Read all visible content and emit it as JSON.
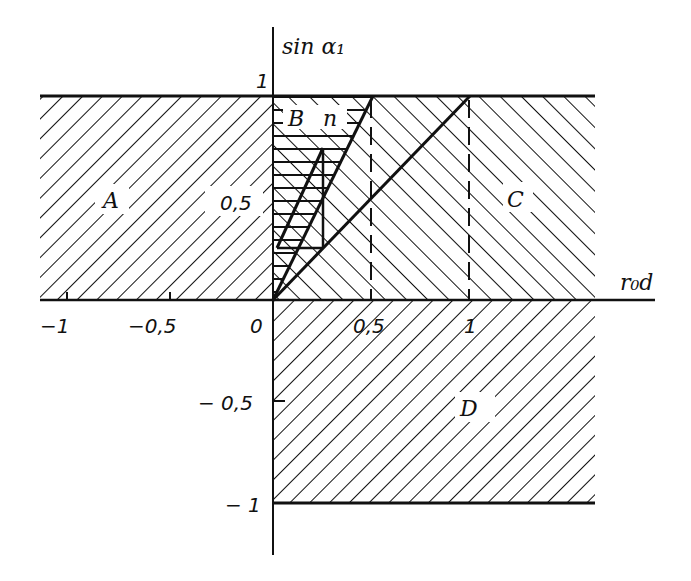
{
  "diagram": {
    "y_axis_label": "sin α₁",
    "x_axis_label": "r₀d",
    "region_labels": {
      "A": "A",
      "B": "B",
      "n": "n",
      "C": "C",
      "D": "D"
    },
    "x_ticks": [
      {
        "label": "−1",
        "value": -1
      },
      {
        "label": "−0,5",
        "value": -0.5
      },
      {
        "label": "0",
        "value": 0
      },
      {
        "label": "0,5",
        "value": 0.5
      },
      {
        "label": "1",
        "value": 1
      }
    ],
    "y_ticks": [
      {
        "label": "1",
        "value": 1
      },
      {
        "label": "0,5",
        "value": 0.5
      },
      {
        "label": "− 0,5",
        "value": -0.5
      },
      {
        "label": "− 1",
        "value": -1
      }
    ],
    "lines": [
      {
        "name": "boundary-line-half",
        "from": [
          0,
          0
        ],
        "to": [
          0.5,
          1
        ]
      },
      {
        "name": "boundary-line-one",
        "from": [
          0,
          0
        ],
        "to": [
          1,
          1
        ]
      }
    ],
    "dashed_verticals": [
      0.5,
      1
    ],
    "colors": {
      "ink": "#111111",
      "background": "#ffffff"
    }
  }
}
